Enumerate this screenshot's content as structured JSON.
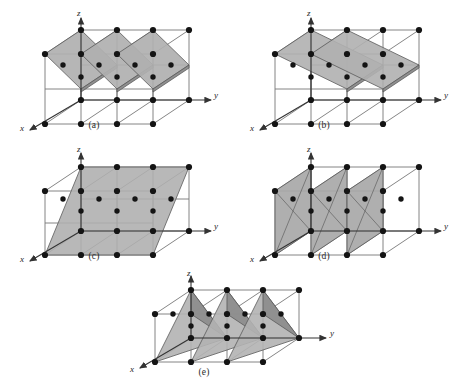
{
  "figure": {
    "background_color": "#ffffff",
    "line_color": "#6e6e6e",
    "node_color": "#141414",
    "plane_fill_light": "#b4b4b4",
    "plane_fill_dark": "#8c8c8c",
    "plane_stroke": "#5a5a5a",
    "axis_color": "#333333"
  },
  "axes": {
    "x_label": "x",
    "y_label": "y",
    "z_label": "z"
  },
  "panels": [
    {
      "id": "a",
      "caption": "(a)",
      "plane_style": "inclined-diagonal",
      "plane_count": 3,
      "description": "Three inclined planes cutting diagonally through the three unit cells"
    },
    {
      "id": "b",
      "caption": "(b)",
      "plane_style": "shallow-inclined",
      "plane_count": 3,
      "description": "Three shallow, nearly horizontal inclined planes through the three unit cells"
    },
    {
      "id": "c",
      "caption": "(c)",
      "plane_style": "single-large-inclined",
      "plane_count": 1,
      "description": "One large inclined plane spanning all three unit cells"
    },
    {
      "id": "d",
      "caption": "(d)",
      "plane_style": "vertical",
      "plane_count": 3,
      "description": "Three vertical planes perpendicular to the y axis"
    },
    {
      "id": "e",
      "caption": "(e)",
      "plane_style": "triangular",
      "plane_count": 3,
      "description": "Three triangular corner-cutting planes"
    }
  ]
}
